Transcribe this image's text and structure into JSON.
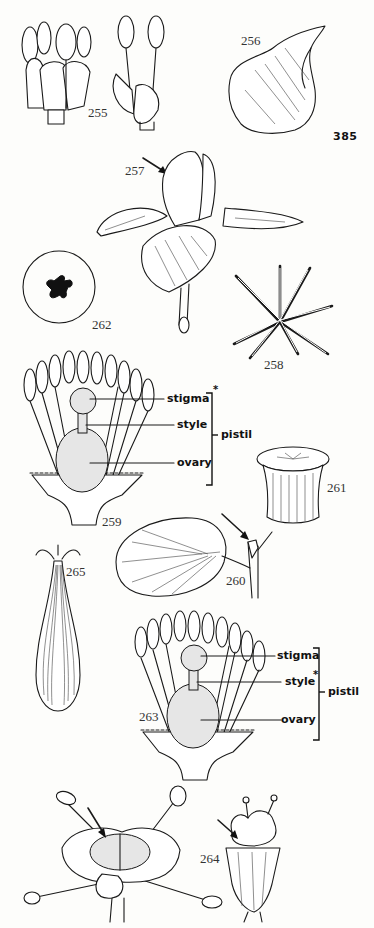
{
  "page": {
    "page_number": "385",
    "background": "#fdfdfb",
    "ink_color": "#1a1a1a"
  },
  "figures": [
    {
      "id": "255",
      "label": "255",
      "subject": "flower with stamens (two views)"
    },
    {
      "id": "256",
      "label": "256",
      "subject": "petal"
    },
    {
      "id": "257",
      "label": "257",
      "subject": "iris flower with arrow"
    },
    {
      "id": "262",
      "label": "262",
      "subject": "cross-section of ovary/stigma in circle"
    },
    {
      "id": "258",
      "label": "258",
      "subject": "radiating stigma branches"
    },
    {
      "id": "259",
      "label": "259",
      "subject": "longitudinal section of flower with pistil labeled"
    },
    {
      "id": "261",
      "label": "261",
      "subject": "disc-shaped stigma"
    },
    {
      "id": "260",
      "label": "260",
      "subject": "leaf with stipule and arrow"
    },
    {
      "id": "265",
      "label": "265",
      "subject": "elongated fruit/ovary with stigma"
    },
    {
      "id": "263",
      "label": "263",
      "subject": "longitudinal section of flower with pistil labeled"
    },
    {
      "id": "264",
      "label": "264",
      "subject": "flower with stamens and pistil (two views) with arrows"
    }
  ],
  "annotations": {
    "fig259": {
      "stigma": "stigma",
      "style": "style",
      "ovary": "ovary",
      "pistil": "pistil",
      "asterisk": "*"
    },
    "fig263": {
      "stigma": "stigma",
      "style": "style",
      "ovary": "ovary",
      "pistil": "pistil",
      "asterisk": "*"
    }
  }
}
